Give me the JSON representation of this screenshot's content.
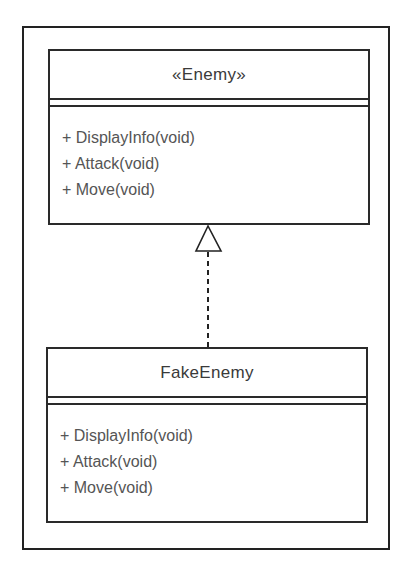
{
  "diagram": {
    "type": "UML class diagram",
    "classes": [
      {
        "name": "«Enemy»",
        "stereotype": "interface",
        "operations": [
          "+ DisplayInfo(void)",
          "+ Attack(void)",
          "+ Move(void)"
        ]
      },
      {
        "name": "FakeEnemy",
        "operations": [
          "+ DisplayInfo(void)",
          "+ Attack(void)",
          "+ Move(void)"
        ]
      }
    ],
    "relations": [
      {
        "from": "FakeEnemy",
        "to": "«Enemy»",
        "kind": "realization",
        "line": "dashed",
        "arrowhead": "hollow-triangle"
      }
    ]
  }
}
